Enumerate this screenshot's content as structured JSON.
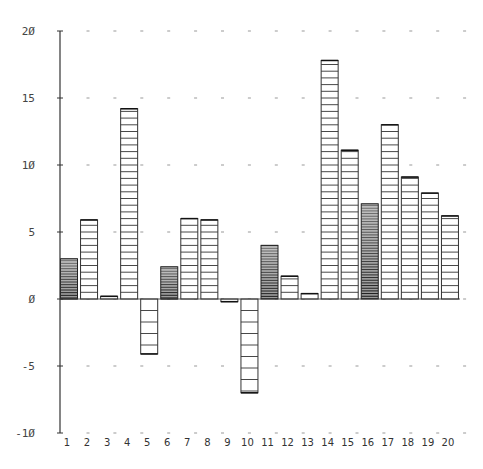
{
  "chart_data": {
    "type": "bar",
    "title": "",
    "xlabel": "",
    "ylabel": "",
    "categories": [
      "1",
      "2",
      "3",
      "4",
      "5",
      "6",
      "7",
      "8",
      "9",
      "10",
      "11",
      "12",
      "13",
      "14",
      "15",
      "16",
      "17",
      "18",
      "19",
      "20"
    ],
    "values": [
      3.0,
      5.9,
      0.2,
      14.2,
      -4.1,
      2.4,
      6.0,
      5.9,
      -0.2,
      -7.0,
      4.0,
      1.7,
      0.4,
      17.8,
      11.1,
      7.1,
      13.0,
      9.1,
      7.9,
      6.2
    ],
    "fill_style": [
      "dense",
      "lined",
      "lined",
      "lined",
      "lined",
      "dense",
      "lined",
      "lined",
      "lined",
      "lined",
      "dense",
      "lined",
      "lined",
      "lined",
      "lined",
      "dense",
      "lined",
      "lined",
      "lined",
      "lined"
    ],
    "ylim": [
      -10,
      20
    ],
    "y_ticks": [
      20,
      15,
      10,
      5,
      0,
      -5,
      -10
    ],
    "y_tick_labels": [
      "2Ø",
      "15",
      "1Ø",
      "5",
      "Ø",
      "-5",
      "-1Ø"
    ],
    "grid": "dashed dots at y ticks",
    "legend": "none"
  },
  "colors": {
    "ink": "#333333",
    "dense_fill": "#555555",
    "grid": "#999999"
  }
}
